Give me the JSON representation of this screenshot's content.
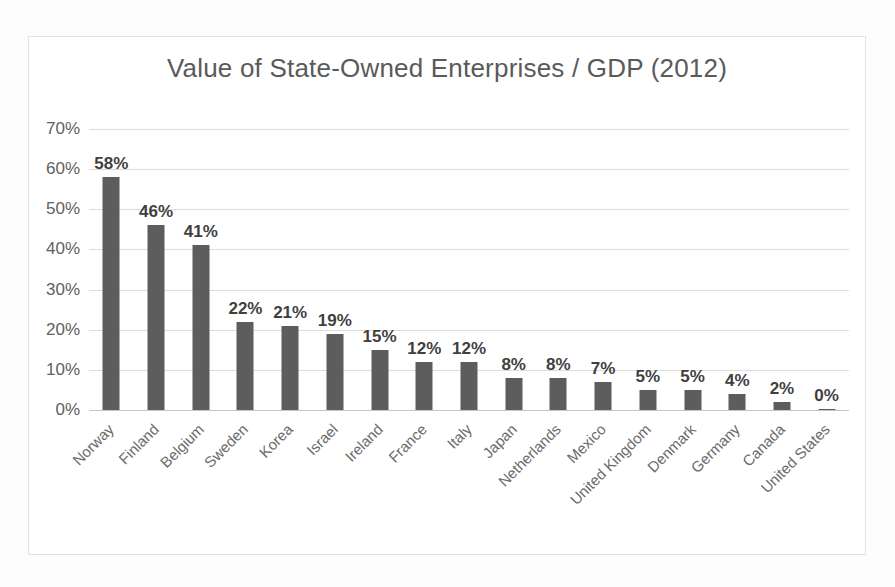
{
  "chart_data": {
    "type": "bar",
    "title": "Value of State-Owned Enterprises / GDP (2012)",
    "xlabel": "",
    "ylabel": "",
    "ylim": [
      0,
      70
    ],
    "ytick_labels": [
      "70%",
      "60%",
      "50%",
      "40%",
      "30%",
      "20%",
      "10%",
      "0%"
    ],
    "ytick_values": [
      70,
      60,
      50,
      40,
      30,
      20,
      10,
      0
    ],
    "grid": true,
    "legend": false,
    "categories": [
      "Norway",
      "Finland",
      "Belgium",
      "Sweden",
      "Korea",
      "Israel",
      "Ireland",
      "France",
      "Italy",
      "Japan",
      "Netherlands",
      "Mexico",
      "United Kingdom",
      "Denmark",
      "Germany",
      "Canada",
      "United States"
    ],
    "values": [
      58,
      46,
      41,
      22,
      21,
      19,
      15,
      12,
      12,
      8,
      8,
      7,
      5,
      5,
      4,
      2,
      0
    ],
    "value_labels": [
      "58%",
      "46%",
      "41%",
      "22%",
      "21%",
      "19%",
      "15%",
      "12%",
      "12%",
      "8%",
      "8%",
      "7%",
      "5%",
      "5%",
      "4%",
      "2%",
      "0%"
    ],
    "bar_color": "#5d5d5d",
    "gridline_color": "#dcdcdc",
    "title_color": "#5a5a5a",
    "background_color": "#ffffff"
  }
}
